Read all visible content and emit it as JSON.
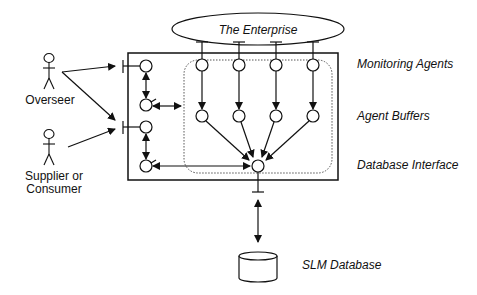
{
  "diagram": {
    "enterprise": {
      "label": "The Enterprise"
    },
    "actors": [
      {
        "id": "overseer",
        "label_lines": [
          "Overseer"
        ]
      },
      {
        "id": "supplier",
        "label_lines": [
          "Supplier or",
          "Consumer"
        ]
      }
    ],
    "layers": {
      "monitoring": "Monitoring Agents",
      "buffers": "Agent Buffers",
      "db_interface": "Database Interface",
      "database": "SLM Database"
    },
    "colors": {
      "stroke": "#111111",
      "background": "#ffffff"
    }
  }
}
